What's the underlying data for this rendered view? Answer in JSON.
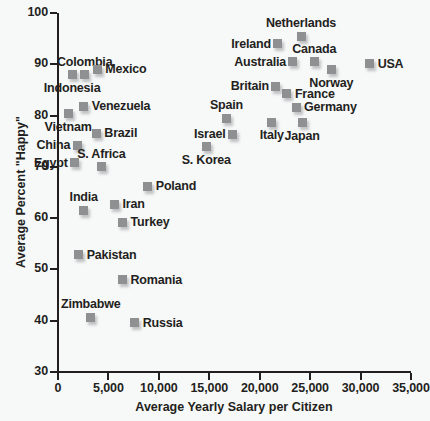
{
  "chart_data": {
    "type": "scatter",
    "title": "",
    "xlabel": "Average Yearly Salary per Citizen",
    "ylabel": "Average Percent \"Happy\"",
    "xlim": [
      0,
      35000
    ],
    "ylim": [
      30,
      100
    ],
    "xticks": [
      "0",
      "5,000",
      "10,000",
      "15,000",
      "20,000",
      "25,000",
      "30,000",
      "35,000"
    ],
    "xtick_values": [
      0,
      5000,
      10000,
      15000,
      20000,
      25000,
      30000,
      35000
    ],
    "yticks": [
      "30",
      "40",
      "50",
      "60",
      "70",
      "80",
      "90",
      "100"
    ],
    "ytick_values": [
      30,
      40,
      50,
      60,
      70,
      80,
      90,
      100
    ],
    "grid": false,
    "legend": "none",
    "marker_color": "#8e9092",
    "axis_color": "#231f20",
    "background_color": "#f7f8f8",
    "points": [
      {
        "label": "Indonesia",
        "x": 1400,
        "y": 88.0,
        "pos": "below"
      },
      {
        "label": "Colombia",
        "x": 2650,
        "y": 88.0,
        "pos": "above"
      },
      {
        "label": "Mexico",
        "x": 3900,
        "y": 89.0,
        "pos": "right"
      },
      {
        "label": "Vietnam",
        "x": 1000,
        "y": 80.4,
        "pos": "below"
      },
      {
        "label": "Venezuela",
        "x": 2550,
        "y": 81.8,
        "pos": "right"
      },
      {
        "label": "Brazil",
        "x": 3800,
        "y": 76.6,
        "pos": "right"
      },
      {
        "label": "China",
        "x": 1900,
        "y": 74.2,
        "pos": "left"
      },
      {
        "label": "Egypt",
        "x": 1650,
        "y": 70.8,
        "pos": "left"
      },
      {
        "label": "S. Africa",
        "x": 4300,
        "y": 70.0,
        "pos": "above"
      },
      {
        "label": "Poland",
        "x": 8900,
        "y": 66.2,
        "pos": "right"
      },
      {
        "label": "Iran",
        "x": 5600,
        "y": 62.7,
        "pos": "right"
      },
      {
        "label": "India",
        "x": 2550,
        "y": 61.5,
        "pos": "above"
      },
      {
        "label": "Turkey",
        "x": 6400,
        "y": 59.2,
        "pos": "right"
      },
      {
        "label": "Pakistan",
        "x": 2050,
        "y": 52.9,
        "pos": "right"
      },
      {
        "label": "Romania",
        "x": 6400,
        "y": 48.0,
        "pos": "right"
      },
      {
        "label": "Zimbabwe",
        "x": 3250,
        "y": 40.7,
        "pos": "above"
      },
      {
        "label": "Russia",
        "x": 7600,
        "y": 39.6,
        "pos": "right"
      },
      {
        "label": "S. Korea",
        "x": 14700,
        "y": 73.9,
        "pos": "below"
      },
      {
        "label": "Israel",
        "x": 17300,
        "y": 76.4,
        "pos": "left"
      },
      {
        "label": "Spain",
        "x": 16700,
        "y": 79.5,
        "pos": "above"
      },
      {
        "label": "Italy",
        "x": 21200,
        "y": 78.7,
        "pos": "below"
      },
      {
        "label": "Japan",
        "x": 24200,
        "y": 78.6,
        "pos": "below"
      },
      {
        "label": "Germany",
        "x": 23600,
        "y": 81.6,
        "pos": "right"
      },
      {
        "label": "France",
        "x": 22700,
        "y": 84.3,
        "pos": "right"
      },
      {
        "label": "Britain",
        "x": 21600,
        "y": 85.7,
        "pos": "left"
      },
      {
        "label": "Norway",
        "x": 27100,
        "y": 88.9,
        "pos": "below"
      },
      {
        "label": "Australia",
        "x": 23300,
        "y": 90.5,
        "pos": "left"
      },
      {
        "label": "Canada",
        "x": 25400,
        "y": 90.5,
        "pos": "above"
      },
      {
        "label": "Ireland",
        "x": 21800,
        "y": 94.0,
        "pos": "left"
      },
      {
        "label": "Netherlands",
        "x": 24100,
        "y": 95.5,
        "pos": "above"
      },
      {
        "label": "USA",
        "x": 30900,
        "y": 90.1,
        "pos": "right"
      }
    ]
  }
}
